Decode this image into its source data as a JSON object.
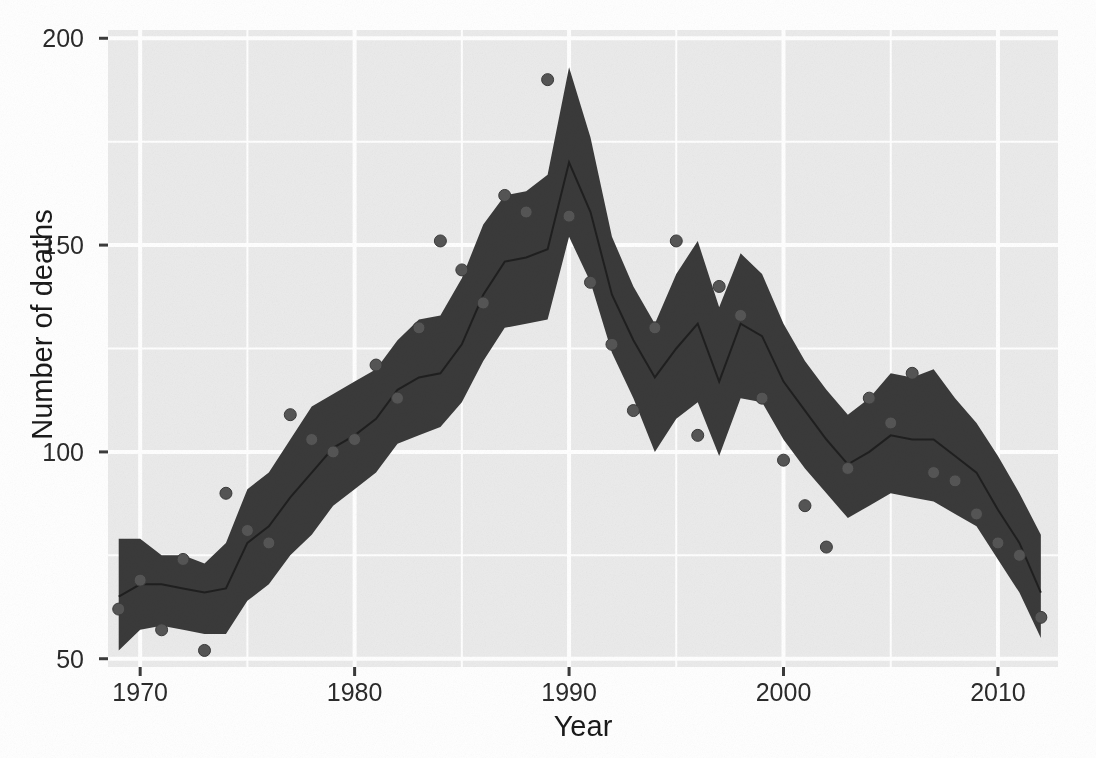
{
  "chart_data": {
    "type": "line",
    "title": "",
    "subtitle": "",
    "xlabel": "Year",
    "ylabel": "Number of deaths",
    "xlim": [
      1968.5,
      2012.8
    ],
    "ylim": [
      48,
      202
    ],
    "grid": true,
    "legend": null,
    "x_ticks": [
      1970,
      1980,
      1990,
      2000,
      2010
    ],
    "x_tick_labels": [
      "1970",
      "1980",
      "1990",
      "2000",
      "2010"
    ],
    "x_minor_ticks": [
      1975,
      1985,
      1995,
      2005
    ],
    "y_ticks": [
      50,
      100,
      150,
      200
    ],
    "y_tick_labels": [
      "50",
      "100",
      "150",
      "200"
    ],
    "y_minor_ticks": [
      75,
      125,
      175
    ],
    "series": [
      {
        "name": "fitted",
        "type": "line",
        "color": "#3a3a3a",
        "x": [
          1969,
          1970,
          1971,
          1972,
          1973,
          1974,
          1975,
          1976,
          1977,
          1978,
          1979,
          1980,
          1981,
          1982,
          1983,
          1984,
          1985,
          1986,
          1987,
          1988,
          1989,
          1990,
          1991,
          1992,
          1993,
          1994,
          1995,
          1996,
          1997,
          1998,
          1999,
          2000,
          2001,
          2002,
          2003,
          2004,
          2005,
          2006,
          2007,
          2008,
          2009,
          2010,
          2011,
          2012
        ],
        "y": [
          65,
          68,
          68,
          67,
          66,
          67,
          78,
          82,
          89,
          95,
          101,
          104,
          108,
          115,
          118,
          119,
          126,
          138,
          146,
          147,
          149,
          170,
          158,
          138,
          127,
          118,
          125,
          131,
          117,
          131,
          128,
          117,
          110,
          103,
          97,
          100,
          104,
          103,
          103,
          99,
          95,
          86,
          78,
          66
        ]
      },
      {
        "name": "ribbon-upper",
        "type": "band-upper",
        "color": "#3a3a3a",
        "x": [
          1969,
          1970,
          1971,
          1972,
          1973,
          1974,
          1975,
          1976,
          1977,
          1978,
          1979,
          1980,
          1981,
          1982,
          1983,
          1984,
          1985,
          1986,
          1987,
          1988,
          1989,
          1990,
          1991,
          1992,
          1993,
          1994,
          1995,
          1996,
          1997,
          1998,
          1999,
          2000,
          2001,
          2002,
          2003,
          2004,
          2005,
          2006,
          2007,
          2008,
          2009,
          2010,
          2011,
          2012
        ],
        "y": [
          79,
          79,
          75,
          75,
          73,
          78,
          91,
          95,
          103,
          111,
          114,
          117,
          120,
          127,
          132,
          133,
          142,
          155,
          162,
          163,
          167,
          193,
          176,
          152,
          140,
          131,
          143,
          151,
          135,
          148,
          143,
          131,
          122,
          115,
          109,
          113,
          119,
          118,
          120,
          113,
          107,
          99,
          90,
          80
        ]
      },
      {
        "name": "ribbon-lower",
        "type": "band-lower",
        "color": "#3a3a3a",
        "x": [
          1969,
          1970,
          1971,
          1972,
          1973,
          1974,
          1975,
          1976,
          1977,
          1978,
          1979,
          1980,
          1981,
          1982,
          1983,
          1984,
          1985,
          1986,
          1987,
          1988,
          1989,
          1990,
          1991,
          1992,
          1993,
          1994,
          1995,
          1996,
          1997,
          1998,
          1999,
          2000,
          2001,
          2002,
          2003,
          2004,
          2005,
          2006,
          2007,
          2008,
          2009,
          2010,
          2011,
          2012
        ],
        "y": [
          52,
          57,
          58,
          57,
          56,
          56,
          64,
          68,
          75,
          80,
          87,
          91,
          95,
          102,
          104,
          106,
          112,
          122,
          130,
          131,
          132,
          152,
          141,
          124,
          113,
          100,
          108,
          112,
          99,
          113,
          112,
          103,
          96,
          90,
          84,
          87,
          90,
          89,
          88,
          85,
          82,
          74,
          66,
          55
        ]
      },
      {
        "name": "observed",
        "type": "scatter",
        "color": "#4a4a4a",
        "points": [
          [
            1969,
            62
          ],
          [
            1970,
            69
          ],
          [
            1971,
            57
          ],
          [
            1972,
            74
          ],
          [
            1973,
            52
          ],
          [
            1974,
            90
          ],
          [
            1975,
            81
          ],
          [
            1976,
            78
          ],
          [
            1977,
            109
          ],
          [
            1978,
            103
          ],
          [
            1979,
            100
          ],
          [
            1980,
            103
          ],
          [
            1981,
            121
          ],
          [
            1982,
            113
          ],
          [
            1983,
            130
          ],
          [
            1984,
            151
          ],
          [
            1985,
            144
          ],
          [
            1986,
            136
          ],
          [
            1987,
            162
          ],
          [
            1988,
            158
          ],
          [
            1989,
            190
          ],
          [
            1990,
            157
          ],
          [
            1991,
            141
          ],
          [
            1992,
            126
          ],
          [
            1993,
            110
          ],
          [
            1994,
            130
          ],
          [
            1995,
            151
          ],
          [
            1996,
            104
          ],
          [
            1997,
            140
          ],
          [
            1998,
            133
          ],
          [
            1999,
            113
          ],
          [
            2000,
            98
          ],
          [
            2001,
            87
          ],
          [
            2002,
            77
          ],
          [
            2003,
            96
          ],
          [
            2004,
            113
          ],
          [
            2005,
            107
          ],
          [
            2006,
            119
          ],
          [
            2007,
            95
          ],
          [
            2008,
            93
          ],
          [
            2009,
            85
          ],
          [
            2010,
            78
          ],
          [
            2011,
            75
          ],
          [
            2012,
            60
          ]
        ]
      }
    ]
  },
  "axes": {
    "ylabel": "Number of deaths",
    "xlabel": "Year",
    "y_tick_labels": [
      "200",
      "150",
      "100",
      "50"
    ],
    "x_tick_labels": [
      "1970",
      "1980",
      "1990",
      "2000",
      "2010"
    ]
  },
  "colors": {
    "panel_background": "#ebebeb",
    "grid_major": "#ffffff",
    "grid_minor": "#ffffff",
    "ribbon": "#3a3a3a",
    "line": "#2e2e2e",
    "points": "#4d4d4d",
    "text": "#1a1a1a",
    "page_background": "#ffffff"
  }
}
